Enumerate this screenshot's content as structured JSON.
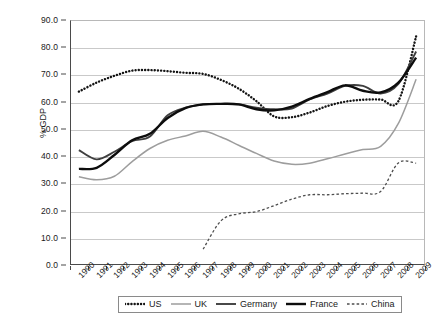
{
  "axis": {
    "y_title": "% GDP",
    "y_ticks": [
      "90.0",
      "80.0",
      "70.0",
      "60.0",
      "50.0",
      "40.0",
      "30.0",
      "20.0",
      "10.0",
      "0.0"
    ],
    "x_ticks": [
      "1990",
      "1991",
      "1992",
      "1993",
      "1994",
      "1995",
      "1996",
      "1997",
      "1998",
      "1999",
      "2000",
      "2001",
      "2002",
      "2003",
      "2004",
      "2005",
      "2006",
      "2007",
      "2008",
      "2009"
    ]
  },
  "legend": {
    "entries": [
      {
        "label": "US",
        "style": "dotted-heavy",
        "color": "#141414"
      },
      {
        "label": "UK",
        "style": "solid-light",
        "color": "#9d9d9d"
      },
      {
        "label": "Germany",
        "style": "solid-medium",
        "color": "#3f3f3f"
      },
      {
        "label": "France",
        "style": "solid-bold",
        "color": "#0d0d0d"
      },
      {
        "label": "China",
        "style": "dashed-thin",
        "color": "#4d4d4d"
      }
    ]
  },
  "chart_data": {
    "type": "line",
    "title": "",
    "xlabel": "",
    "ylabel": "% GDP",
    "ylim": [
      0,
      90
    ],
    "ytick_step": 10,
    "grid": true,
    "legend_position": "bottom",
    "x": [
      "1990",
      "1991",
      "1992",
      "1993",
      "1994",
      "1995",
      "1996",
      "1997",
      "1998",
      "1999",
      "2000",
      "2001",
      "2002",
      "2003",
      "2004",
      "2005",
      "2006",
      "2007",
      "2008",
      "2009"
    ],
    "series": [
      {
        "name": "US",
        "color": "#141414",
        "style": "dotted-heavy",
        "values": [
          63.7,
          67.0,
          69.5,
          71.4,
          71.6,
          71.2,
          70.6,
          70.2,
          68.0,
          64.8,
          60.2,
          54.6,
          54.3,
          56.0,
          58.4,
          60.0,
          60.7,
          60.8,
          60.2,
          84.0
        ]
      },
      {
        "name": "UK",
        "color": "#9d9d9d",
        "style": "solid-light",
        "values": [
          32.4,
          31.3,
          32.6,
          38.0,
          42.8,
          45.8,
          47.4,
          49.1,
          47.0,
          44.0,
          41.0,
          38.2,
          37.0,
          37.4,
          39.0,
          40.8,
          42.4,
          43.6,
          52.0,
          68.2
        ]
      },
      {
        "name": "Germany",
        "color": "#3f3f3f",
        "style": "solid-medium",
        "values": [
          42.2,
          38.8,
          41.6,
          45.5,
          47.2,
          55.0,
          57.8,
          59.0,
          59.2,
          59.0,
          57.8,
          57.2,
          57.5,
          60.8,
          63.0,
          65.8,
          65.8,
          63.0,
          66.5,
          78.4
        ]
      },
      {
        "name": "France",
        "color": "#0d0d0d",
        "style": "solid-bold",
        "values": [
          35.3,
          35.7,
          40.4,
          45.8,
          48.2,
          54.0,
          57.6,
          59.0,
          59.2,
          59.0,
          57.2,
          56.8,
          58.2,
          61.0,
          63.5,
          66.0,
          64.0,
          63.4,
          67.0,
          76.2
        ]
      },
      {
        "name": "China",
        "color": "#4d4d4d",
        "style": "dashed-thin",
        "values": [
          null,
          null,
          null,
          null,
          null,
          null,
          null,
          5.8,
          16.2,
          18.8,
          19.6,
          21.8,
          24.2,
          25.8,
          25.8,
          26.2,
          26.4,
          27.0,
          37.5,
          37.4
        ]
      }
    ],
    "annotations": [
      {
        "note": "China series begins at 1997; no data for 1990-1996"
      },
      {
        "note": "China mid-2008 local peak ~37.5, dips to ~34 then ~37.4 by 2009"
      }
    ]
  }
}
